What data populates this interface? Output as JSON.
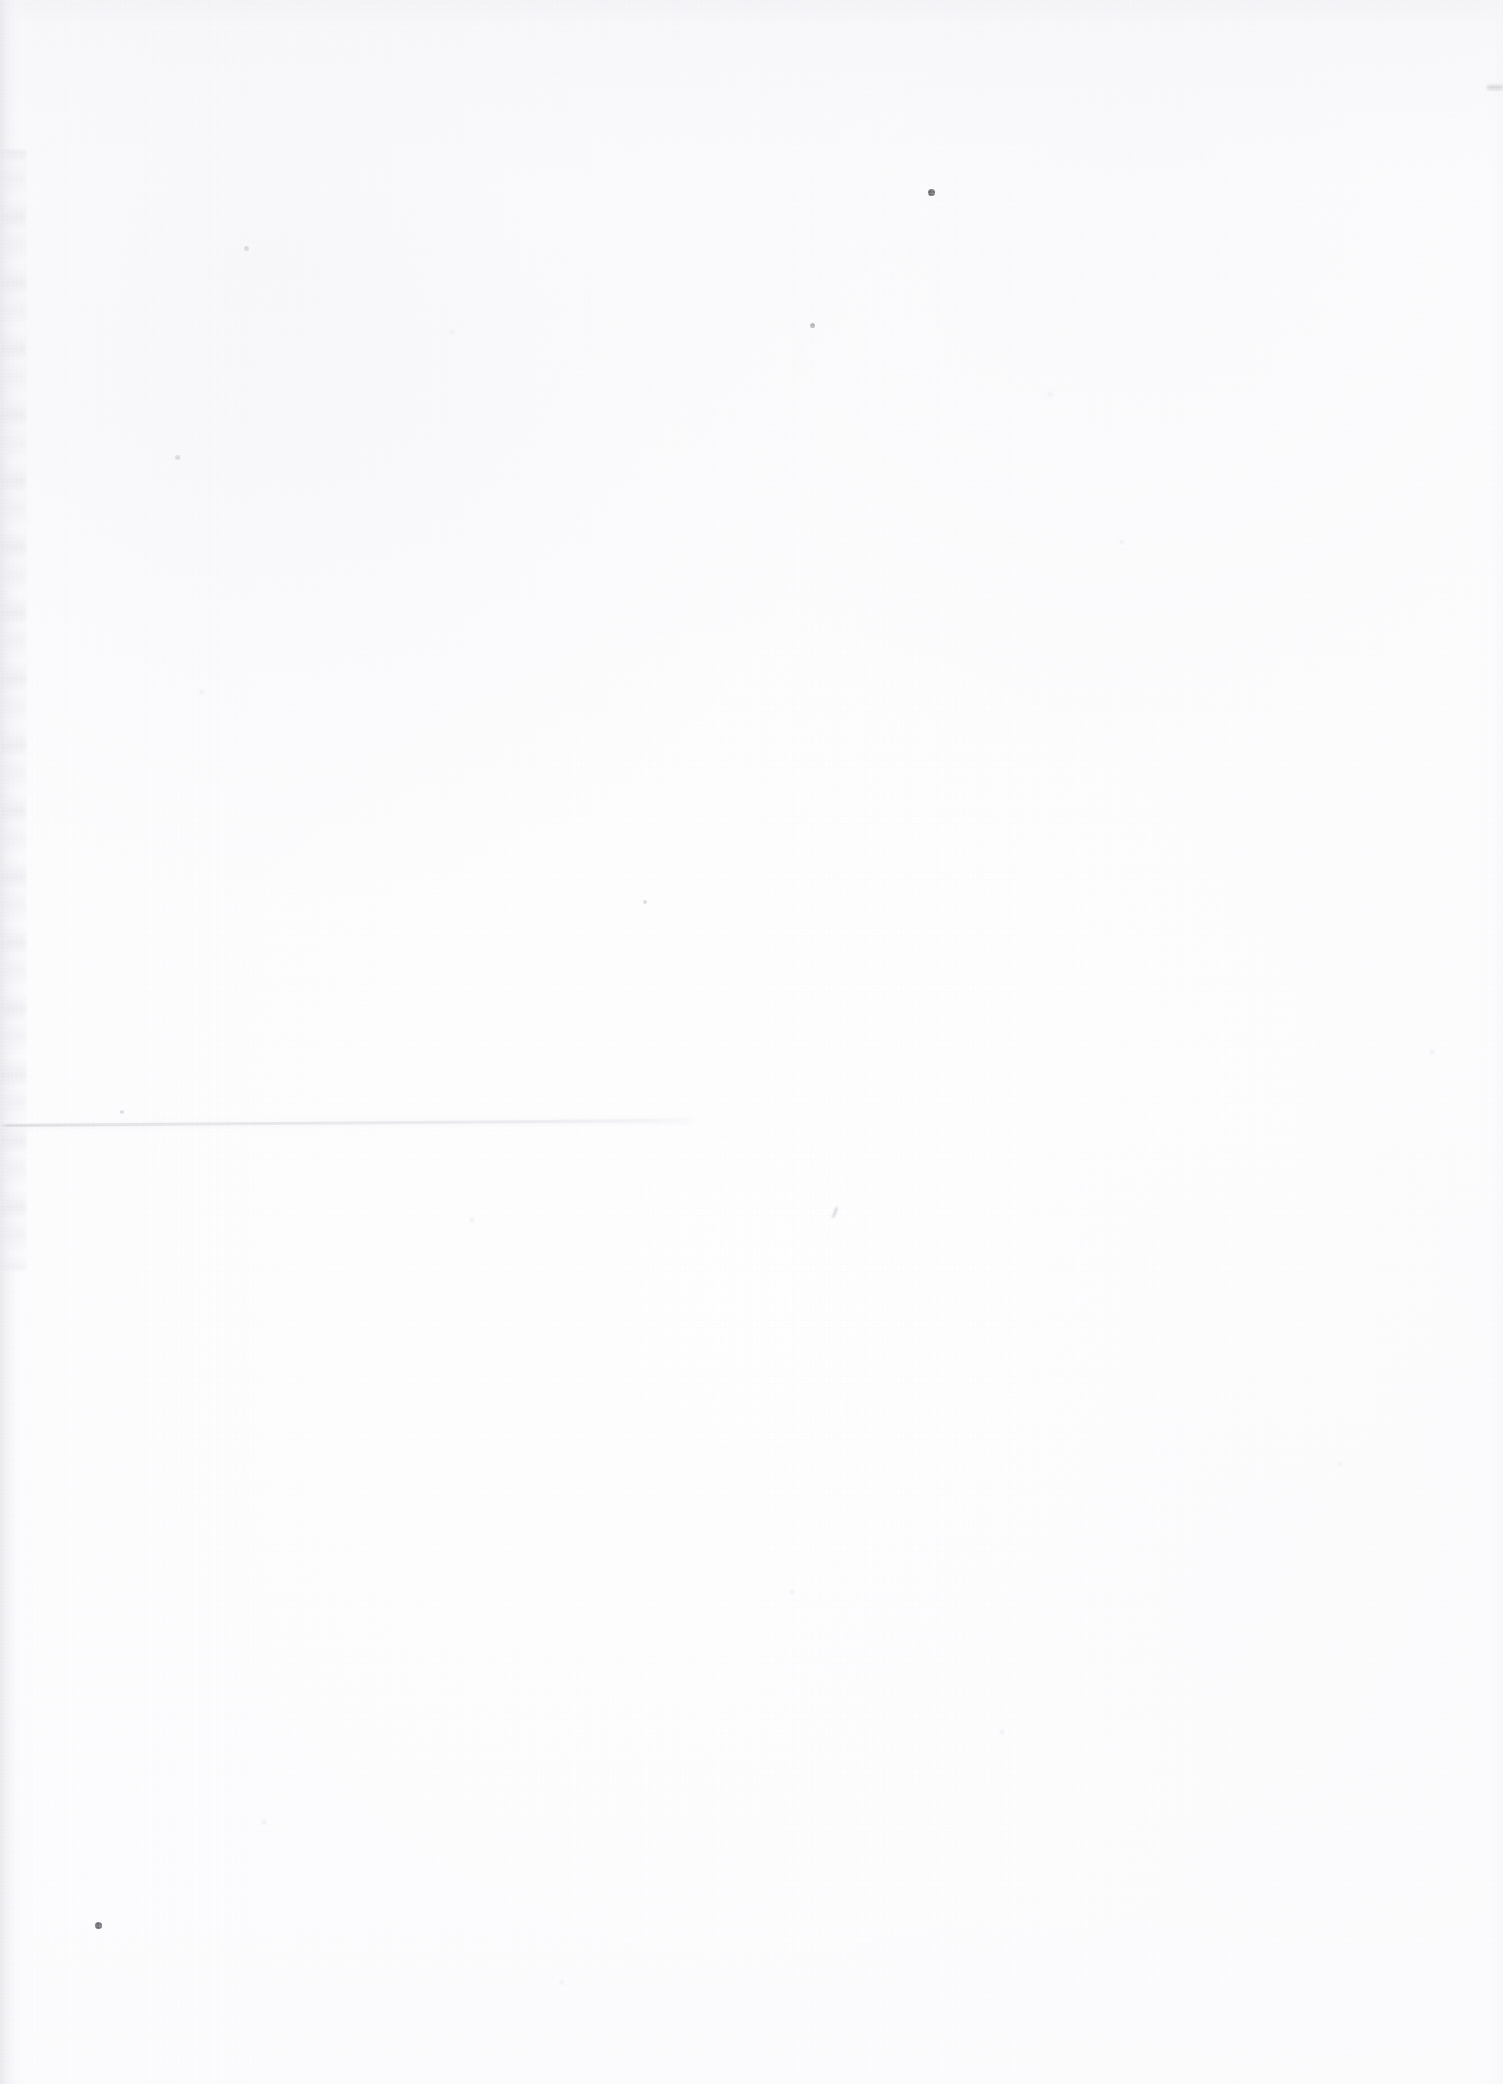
{
  "document": {
    "type": "scanned-page",
    "page_content": "blank",
    "visible_text": "",
    "width_px": 1503,
    "height_px": 2084,
    "orientation": "portrait",
    "description": "Blank scanned sheet of paper (no printed text, headings, figures or page number visible)"
  },
  "colors": {
    "paper_white": "#fdfdfe",
    "paper_highlight": "#ffffff",
    "paper_shade": "#f4f4f7",
    "edge_shadow": "#e2e2e7",
    "crease_line": "#c6c6cd",
    "speck_dark": "#5d5d64",
    "speck_mid": "#96969f",
    "speck_faint": "#cdcdd6"
  },
  "artifacts": {
    "edge_shadow_left": {
      "label": "left-edge scanner shadow",
      "x": 0,
      "y": 0,
      "width": 34,
      "height": 2084
    },
    "crease": {
      "label": "faint horizontal crease / fold line",
      "x": 0,
      "y": 1124,
      "width": 682,
      "angle_deg": -0.42
    },
    "specks": [
      {
        "name": "speck-top-center-dark",
        "x": 928,
        "y": 189,
        "size": 7,
        "tone": "dark"
      },
      {
        "name": "speck-lower-left-dark",
        "x": 95,
        "y": 1922,
        "size": 7,
        "tone": "dark"
      },
      {
        "name": "speck-upper-mid",
        "x": 810,
        "y": 323,
        "size": 5,
        "tone": "mid"
      },
      {
        "name": "speck-mid-lower",
        "x": 834,
        "y": 1207,
        "size": 5,
        "tone": "mid"
      },
      {
        "name": "smudge-top-right",
        "x": 1487,
        "y": 85,
        "size": 12,
        "tone": "mid"
      },
      {
        "name": "speck-left-upper",
        "x": 244,
        "y": 246,
        "size": 5,
        "tone": "faint"
      },
      {
        "name": "speck-left-mid",
        "x": 175,
        "y": 455,
        "size": 5,
        "tone": "faint"
      },
      {
        "name": "speck-center-upper",
        "x": 450,
        "y": 330,
        "size": 4,
        "tone": "ghost"
      },
      {
        "name": "speck-center-mid",
        "x": 643,
        "y": 900,
        "size": 4,
        "tone": "faint"
      },
      {
        "name": "speck-center-low",
        "x": 470,
        "y": 1218,
        "size": 4,
        "tone": "ghost"
      },
      {
        "name": "speck-right-mid",
        "x": 1048,
        "y": 392,
        "size": 4,
        "tone": "ghost"
      },
      {
        "name": "speck-right-low",
        "x": 1338,
        "y": 1462,
        "size": 4,
        "tone": "ghost"
      },
      {
        "name": "speck-bottom-mid",
        "x": 262,
        "y": 1820,
        "size": 4,
        "tone": "ghost"
      },
      {
        "name": "speck-bottom-right",
        "x": 1000,
        "y": 1730,
        "size": 4,
        "tone": "ghost"
      },
      {
        "name": "speck-top-left",
        "x": 200,
        "y": 690,
        "size": 4,
        "tone": "ghost"
      },
      {
        "name": "speck-upper-right",
        "x": 1120,
        "y": 540,
        "size": 4,
        "tone": "ghost"
      },
      {
        "name": "speck-left-low",
        "x": 120,
        "y": 1110,
        "size": 4,
        "tone": "faint"
      },
      {
        "name": "speck-mid-right",
        "x": 790,
        "y": 1590,
        "size": 4,
        "tone": "ghost"
      },
      {
        "name": "speck-center-bottom",
        "x": 560,
        "y": 1980,
        "size": 4,
        "tone": "ghost"
      },
      {
        "name": "speck-far-right",
        "x": 1430,
        "y": 1050,
        "size": 4,
        "tone": "ghost"
      }
    ]
  }
}
